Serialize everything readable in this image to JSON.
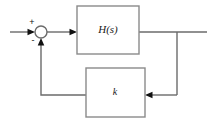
{
  "diagram": {
    "type": "control-system-block-diagram",
    "canvas": {
      "width": 213,
      "height": 128,
      "background": "#ffffff"
    },
    "style": {
      "line_color": "#6b6b6b",
      "box_border_color": "#8a8a8a",
      "box_fill": "#ffffff",
      "text_color": "#1a1a1a",
      "line_width": 1.4,
      "box_border_width": 1.4
    },
    "blocks": [
      {
        "id": "forward-block",
        "label": "H(s)",
        "italic": true,
        "font_size": 11,
        "x": 77,
        "y": 6,
        "width": 62,
        "height": 48,
        "label_cx": 108,
        "label_cy": 30
      },
      {
        "id": "feedback-block",
        "label": "k",
        "italic": true,
        "font_size": 10,
        "x": 86,
        "y": 68,
        "width": 59,
        "height": 49,
        "label_cx": 115,
        "label_cy": 93
      }
    ],
    "summing_junction": {
      "id": "summing-junction",
      "cx": 41,
      "cy": 32,
      "r": 6,
      "plus_sign": {
        "text": "+",
        "x": 32,
        "y": 23
      },
      "minus_sign": {
        "text": "-",
        "x": 33,
        "y": 41
      }
    },
    "signals": [
      {
        "id": "input-signal",
        "name": "input-line",
        "path": "M 10 32 L 33 32",
        "arrow_at": {
          "x": 35,
          "y": 32,
          "dir": "right"
        }
      },
      {
        "id": "error-signal",
        "name": "error-line",
        "path": "M 47 32 L 71 32",
        "arrow_at": {
          "x": 77,
          "y": 32,
          "dir": "right"
        }
      },
      {
        "id": "output-signal",
        "name": "output-line",
        "path": "M 139 32 L 207 32",
        "arrow_at": null
      },
      {
        "id": "feedback-tap-down",
        "name": "feedback-drop-line",
        "path": "M 177 32 L 177 95",
        "arrow_at": null
      },
      {
        "id": "feedback-into-k",
        "name": "feedback-into-gain-line",
        "path": "M 177 95 L 151 95",
        "arrow_at": {
          "x": 145,
          "y": 95,
          "dir": "left"
        }
      },
      {
        "id": "feedback-from-k",
        "name": "feedback-return-line",
        "path": "M 86 95 L 41 95 L 41 44",
        "arrow_at": {
          "x": 41,
          "y": 38,
          "dir": "up"
        }
      }
    ]
  }
}
